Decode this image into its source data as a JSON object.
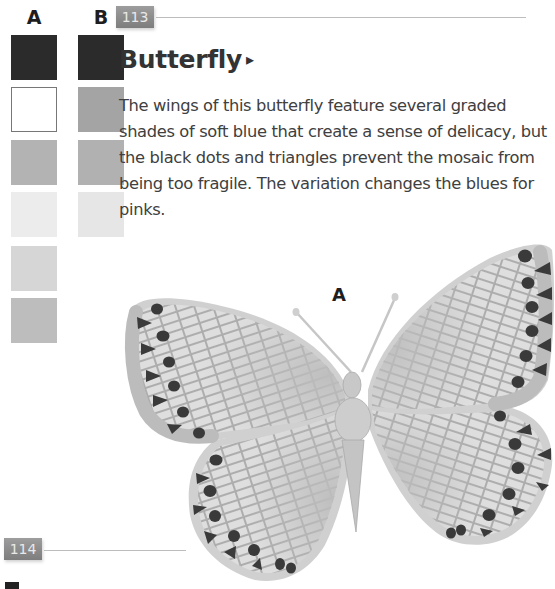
{
  "palette": {
    "columns": [
      {
        "label": "A",
        "swatches": [
          {
            "name": "black",
            "color": "#2b2b2b"
          },
          {
            "name": "white",
            "color": "#ffffff",
            "outlined": true
          },
          {
            "name": "mid-blue-grey",
            "color": "#b3b3b3"
          },
          {
            "name": "very-pale",
            "color": "#ececec"
          },
          {
            "name": "pale",
            "color": "#d6d6d6"
          },
          {
            "name": "medium",
            "color": "#bdbdbd"
          }
        ]
      },
      {
        "label": "B",
        "swatches": [
          {
            "name": "black",
            "color": "#2b2b2b"
          },
          {
            "name": "medium-grey",
            "color": "#a4a4a4"
          },
          {
            "name": "mid-grey",
            "color": "#b1b1b1"
          },
          {
            "name": "very-pale",
            "color": "#e6e6e6"
          }
        ]
      }
    ]
  },
  "entry": {
    "number": "113",
    "title": "Butterfly",
    "title_arrow": "▸",
    "description": "The wings of this butterfly feature several graded shades of soft blue that create a sense of delicacy, but the black dots and triangles prevent the mosaic from being too fragile. The variation changes the blues for pinks.",
    "artwork_label": "A"
  },
  "next_entry": {
    "number": "114"
  },
  "colors": {
    "badge": "#8c8c8c",
    "rule": "#bdbdbd",
    "wing_light": "#e4e4e4",
    "wing_mid": "#c9c9c9",
    "wing_border": "#bababa",
    "spots": "#3a3a3a",
    "grout": "#9a9a9a"
  }
}
